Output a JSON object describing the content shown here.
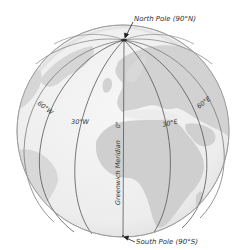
{
  "diagram": {
    "type": "globe-meridians",
    "colors": {
      "ocean": "#efefef",
      "land": "#d4d4d4",
      "rim": "#9a9a9a",
      "meridian": "#555555",
      "text": "#333333",
      "arrow": "#222222"
    },
    "north_pole": {
      "label": "North Pole (90°N)"
    },
    "south_pole": {
      "label": "South Pole (90°S)"
    },
    "meridians": [
      {
        "id": "60W",
        "label": "60°W"
      },
      {
        "id": "30W",
        "label": "30°W"
      },
      {
        "id": "0",
        "label": "0°"
      },
      {
        "id": "30E",
        "label": "30°E"
      },
      {
        "id": "60E",
        "label": "60°E"
      }
    ],
    "prime_meridian_name": "Greenwich Meridian"
  }
}
